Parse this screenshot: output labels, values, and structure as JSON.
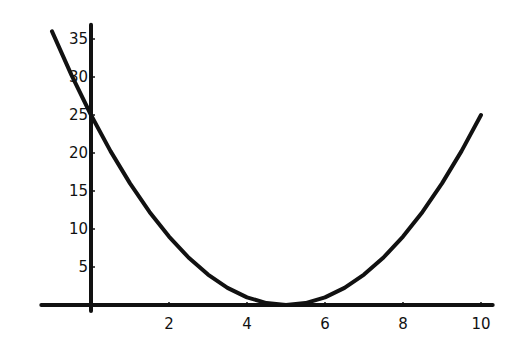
{
  "chart_data": {
    "type": "line",
    "title": "",
    "xlabel": "",
    "ylabel": "",
    "function": "y = (x - 5)^2",
    "xlim": [
      -1.3,
      10.3
    ],
    "ylim": [
      0,
      37
    ],
    "grid": false,
    "legend": null,
    "x_ticks": [
      2,
      4,
      6,
      8,
      10
    ],
    "y_ticks": [
      5,
      10,
      15,
      20,
      25,
      30,
      35
    ],
    "x_tick_labels": [
      "2",
      "4",
      "6",
      "8",
      "10"
    ],
    "y_tick_labels": [
      "5",
      "10",
      "15",
      "20",
      "25",
      "30",
      "35"
    ],
    "series": [
      {
        "name": "parabola",
        "color": "#111111",
        "x": [
          -1,
          -0.5,
          0,
          0.5,
          1,
          1.5,
          2,
          2.5,
          3,
          3.5,
          4,
          4.5,
          5,
          5.5,
          6,
          6.5,
          7,
          7.5,
          8,
          8.5,
          9,
          9.5,
          10
        ],
        "y": [
          36,
          30.25,
          25,
          20.25,
          16,
          12.25,
          9,
          6.25,
          4,
          2.25,
          1,
          0.25,
          0,
          0.25,
          1,
          2.25,
          4,
          6.25,
          9,
          12.25,
          16,
          20.25,
          25
        ]
      }
    ]
  },
  "colors": {
    "background": "#ffffff",
    "ink": "#111111"
  }
}
